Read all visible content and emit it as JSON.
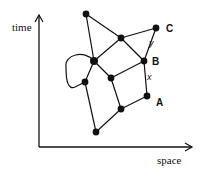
{
  "diagram": {
    "axes": {
      "y_label": "time",
      "x_label": "space"
    },
    "nodes": [
      {
        "id": "n1",
        "label": ""
      },
      {
        "id": "C",
        "label": "C"
      },
      {
        "id": "n3",
        "label": ""
      },
      {
        "id": "B",
        "label": "B"
      },
      {
        "id": "hub",
        "label": ""
      },
      {
        "id": "n6",
        "label": ""
      },
      {
        "id": "n7",
        "label": ""
      },
      {
        "id": "A",
        "label": "A"
      },
      {
        "id": "n9",
        "label": ""
      },
      {
        "id": "n10",
        "label": ""
      }
    ],
    "edges": [
      {
        "from": "n1",
        "to": "n3",
        "label": ""
      },
      {
        "from": "n1",
        "to": "hub",
        "label": ""
      },
      {
        "from": "n3",
        "to": "C",
        "label": ""
      },
      {
        "from": "n3",
        "to": "hub",
        "label": ""
      },
      {
        "from": "n3",
        "to": "B",
        "label": ""
      },
      {
        "from": "C",
        "to": "B",
        "label": "y"
      },
      {
        "from": "B",
        "to": "A",
        "label": "x"
      },
      {
        "from": "B",
        "to": "n6",
        "label": ""
      },
      {
        "from": "hub",
        "to": "n6",
        "label": ""
      },
      {
        "from": "hub",
        "to": "n7",
        "label": ""
      },
      {
        "from": "n6",
        "to": "n9",
        "label": ""
      },
      {
        "from": "n7",
        "to": "n10",
        "label": ""
      },
      {
        "from": "A",
        "to": "n9",
        "label": ""
      },
      {
        "from": "n9",
        "to": "n10",
        "label": ""
      }
    ],
    "loop": {
      "from": "hub",
      "to": "n7"
    }
  }
}
